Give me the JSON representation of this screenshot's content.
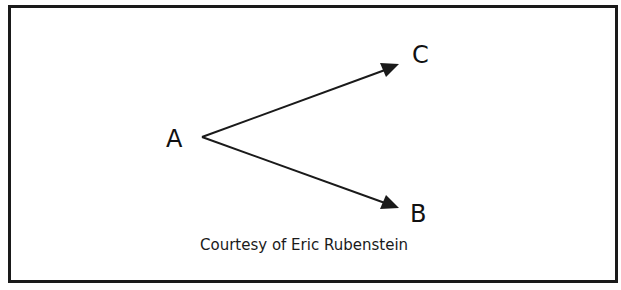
{
  "diagram": {
    "type": "directed-graph",
    "nodes": [
      {
        "id": "A",
        "label": "A"
      },
      {
        "id": "B",
        "label": "B"
      },
      {
        "id": "C",
        "label": "C"
      }
    ],
    "edges": [
      {
        "from": "A",
        "to": "C"
      },
      {
        "from": "A",
        "to": "B"
      }
    ],
    "caption": "Courtesy of Eric Rubenstein",
    "colors": {
      "line": "#1a1a1a",
      "border": "#1a1a1a",
      "background": "#ffffff"
    }
  }
}
